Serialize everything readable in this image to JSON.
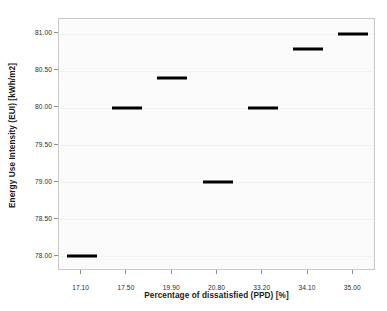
{
  "chart_data": {
    "type": "scatter",
    "title": "",
    "xlabel": "Percentage of dissatisfied (PPD) [%]",
    "ylabel": "Energy Use Intensity (EUI) [kWh/m2]",
    "categories": [
      "17.10",
      "17.50",
      "19.90",
      "20.80",
      "33.20",
      "34.10",
      "35.00"
    ],
    "values": [
      78.0,
      80.0,
      80.4,
      79.0,
      80.0,
      80.8,
      81.0
    ],
    "x_tick_labels": [
      "17.10",
      "17.50",
      "19.90",
      "20.80",
      "33.20",
      "34.10",
      "35.00"
    ],
    "y_tick_labels": [
      "78.00",
      "78.50",
      "79.00",
      "79.50",
      "80.00",
      "80.50",
      "81.00"
    ],
    "y_tick_values": [
      78.0,
      78.5,
      79.0,
      79.5,
      80.0,
      80.5,
      81.0
    ],
    "ylim": [
      77.8,
      81.2
    ],
    "grid": false,
    "legend": null,
    "marker_style": "horizontal-dash",
    "marker_color": "#000000",
    "plot_background": "#fbfbfb",
    "frame_color": "#c9c9c9",
    "series": [
      {
        "name": "EUI",
        "points": [
          {
            "x": "17.10",
            "y": 78.0
          },
          {
            "x": "17.50",
            "y": 80.0
          },
          {
            "x": "19.90",
            "y": 80.4
          },
          {
            "x": "20.80",
            "y": 79.0
          },
          {
            "x": "33.20",
            "y": 80.0
          },
          {
            "x": "34.10",
            "y": 80.8
          },
          {
            "x": "35.00",
            "y": 81.0
          }
        ]
      }
    ]
  }
}
